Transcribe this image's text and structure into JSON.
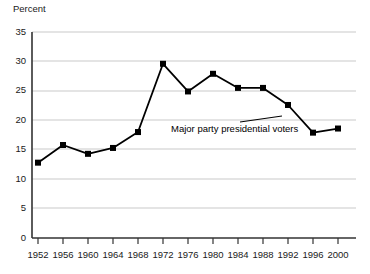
{
  "chart_data": {
    "type": "line",
    "title": "",
    "ylabel": "Percent",
    "xlabel": "",
    "ylim": [
      0,
      35
    ],
    "yticks": [
      0,
      5,
      10,
      15,
      20,
      25,
      30,
      35
    ],
    "grid": true,
    "legend": "none",
    "categories": [
      "1952",
      "1956",
      "1960",
      "1964",
      "1968",
      "1972",
      "1976",
      "1980",
      "1984",
      "1988",
      "1992",
      "1996",
      "2000"
    ],
    "x": [
      1952,
      1956,
      1960,
      1964,
      1968,
      1972,
      1976,
      1980,
      1984,
      1988,
      1992,
      1996,
      2000
    ],
    "values": [
      12.8,
      15.8,
      14.3,
      15.3,
      18.0,
      29.6,
      24.9,
      27.9,
      25.5,
      25.5,
      22.6,
      17.9,
      18.6
    ],
    "series": [
      {
        "name": "Major party presidential voters",
        "values": [
          12.8,
          15.8,
          14.3,
          15.3,
          18.0,
          29.6,
          24.9,
          27.9,
          25.5,
          25.5,
          22.6,
          17.9,
          18.6
        ],
        "color": "#000000",
        "marker": "square"
      }
    ],
    "annotations": [
      {
        "text": "Major party presidential voters",
        "points_to_year": 1992,
        "points_to_value": 22.6
      }
    ]
  },
  "axes": {
    "y_title": "Percent",
    "y_tick_labels": [
      "35",
      "30",
      "25",
      "20",
      "15",
      "10",
      "5",
      "0"
    ],
    "x_tick_labels": [
      "1952",
      "1956",
      "1960",
      "1964",
      "1968",
      "1972",
      "1976",
      "1980",
      "1984",
      "1988",
      "1992",
      "1996",
      "2000"
    ]
  },
  "annotation": {
    "text": "Major party presidential voters"
  },
  "colors": {
    "series": "#000000",
    "grid": "#c9c9c9",
    "axis": "#333333",
    "background": "#ffffff"
  }
}
